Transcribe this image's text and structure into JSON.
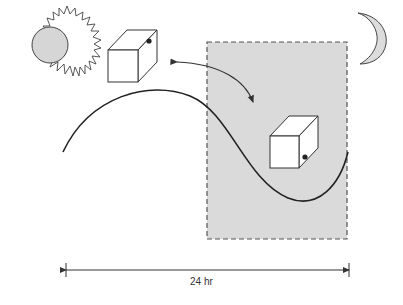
{
  "diagram": {
    "colors": {
      "stroke": "#333333",
      "night_fill": "#d9d9d9",
      "sun_fill": "#d4d4d4",
      "moon_fill": "#dcdcdc",
      "cube_fill": "#ffffff"
    },
    "elements": {
      "sun": "sun-icon",
      "moon": "moon-icon",
      "day_cube": "cube-day",
      "night_cube": "cube-night",
      "night_region": "night-shaded-region",
      "cycle_curve": "sinusoidal-curve",
      "transition_arrow": "double-headed-arrow"
    },
    "timeline": {
      "label": "24 hr"
    }
  }
}
